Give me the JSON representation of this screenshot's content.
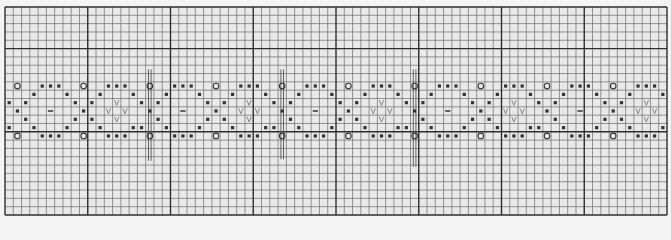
{
  "chart_data": {
    "type": "knitting-chart",
    "title": "",
    "grid": {
      "columns": 80,
      "rows": 25,
      "major_every": 10,
      "major_row_lines_from_top": [
        0,
        5,
        15,
        25
      ],
      "major_col_lines_from_left": [
        0,
        10,
        20,
        30,
        40,
        50,
        60,
        70,
        80
      ]
    },
    "colors": {
      "background": "#e9e9e9",
      "minor_line": "#6a6a6a",
      "major_line": "#2e2e2e",
      "symbol": "#333333",
      "v_symbol": "#777777",
      "bar": "#555555"
    },
    "symbol_legend": {
      "O": "circle",
      "x": "small-filled-square",
      "-": "dash",
      "V": "v-mark"
    },
    "repeat": {
      "width_columns": 16,
      "start_row": 9,
      "start_col": 0,
      "count": 5,
      "rows": [
        [
          {
            "col": 1,
            "sym": "O"
          },
          {
            "col": 4,
            "sym": "x"
          },
          {
            "col": 5,
            "sym": "x"
          },
          {
            "col": 6,
            "sym": "x"
          },
          {
            "col": 9,
            "sym": "O"
          },
          {
            "col": 12,
            "sym": "x"
          },
          {
            "col": 13,
            "sym": "x"
          },
          {
            "col": 14,
            "sym": "x"
          }
        ],
        [
          {
            "col": 3,
            "sym": "x"
          },
          {
            "col": 7,
            "sym": "x"
          },
          {
            "col": 11,
            "sym": "x"
          },
          {
            "col": 15,
            "sym": "x"
          }
        ],
        [
          {
            "col": 0,
            "sym": "x"
          },
          {
            "col": 2,
            "sym": "x"
          },
          {
            "col": 8,
            "sym": "x"
          },
          {
            "col": 10,
            "sym": "x"
          },
          {
            "col": 13,
            "sym": "V"
          }
        ],
        [
          {
            "col": 1,
            "sym": "x"
          },
          {
            "col": 5,
            "sym": "-"
          },
          {
            "col": 9,
            "sym": "x"
          },
          {
            "col": 12,
            "sym": "V"
          },
          {
            "col": 14,
            "sym": "V"
          }
        ],
        [
          {
            "col": 2,
            "sym": "x"
          },
          {
            "col": 8,
            "sym": "x"
          },
          {
            "col": 10,
            "sym": "x"
          },
          {
            "col": 13,
            "sym": "V"
          }
        ],
        [
          {
            "col": 0,
            "sym": "x"
          },
          {
            "col": 3,
            "sym": "x"
          },
          {
            "col": 7,
            "sym": "x"
          },
          {
            "col": 11,
            "sym": "x"
          },
          {
            "col": 15,
            "sym": "x"
          }
        ],
        [
          {
            "col": 1,
            "sym": "O"
          },
          {
            "col": 4,
            "sym": "x"
          },
          {
            "col": 5,
            "sym": "x"
          },
          {
            "col": 6,
            "sym": "x"
          },
          {
            "col": 9,
            "sym": "O"
          },
          {
            "col": 12,
            "sym": "x"
          },
          {
            "col": 13,
            "sym": "x"
          },
          {
            "col": 14,
            "sym": "x"
          }
        ]
      ]
    },
    "repeat_markers": [
      {
        "col": 17,
        "row_from": 7.5,
        "row_to": 18.5
      },
      {
        "col": 33,
        "row_from": 7.5,
        "row_to": 18.3
      },
      {
        "col": 49,
        "row_from": 7.5,
        "row_to": 19.2
      }
    ]
  }
}
